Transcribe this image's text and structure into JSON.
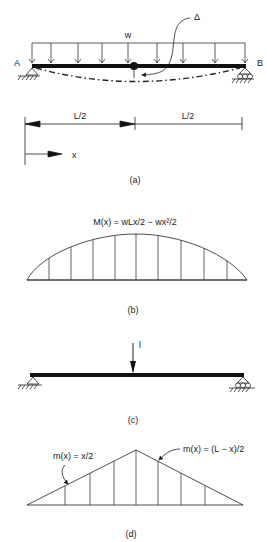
{
  "figure_a": {
    "load_label": "w",
    "deflection_label": "Δ",
    "support_left_label": "A",
    "support_right_label": "B",
    "half_span_left": "L/2",
    "half_span_right": "L/2",
    "axis_label": "x",
    "caption": "(a)"
  },
  "figure_b": {
    "equation": "M(x) = wLx/2 − wx²/2",
    "caption": "(b)"
  },
  "figure_c": {
    "unit_load_label": "l",
    "caption": "(c)"
  },
  "figure_d": {
    "left_equation": "m(x) = x/2",
    "right_equation": "m(x) = (L − x)/2",
    "caption": "(d)"
  }
}
